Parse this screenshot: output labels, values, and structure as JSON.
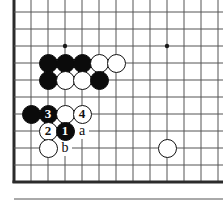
{
  "diagram": {
    "kind": "go-board-diagram",
    "board": {
      "grid_spacing_px": 17,
      "origin_x_px": 14,
      "origin_y_px": 12,
      "columns_visible": 13,
      "rows_visible": 11,
      "line_color": "#555555",
      "edge_color": "#2b2b2b",
      "background_color": "#ffffff",
      "left_edge_is_board_border": true,
      "bottom_edge_is_board_border": true,
      "top_edge_is_cut_off": true,
      "right_edge_is_cut_off": true
    },
    "star_points": [
      {
        "name": "star-point-left",
        "col": 3,
        "row": 2
      },
      {
        "name": "star-point-right",
        "col": 9,
        "row": 2
      }
    ],
    "stones": [
      {
        "name": "black-stone-c4",
        "color": "black",
        "col": 2,
        "row": 3,
        "label": ""
      },
      {
        "name": "black-stone-d4",
        "color": "black",
        "col": 3,
        "row": 3,
        "label": ""
      },
      {
        "name": "black-stone-e4",
        "color": "black",
        "col": 4,
        "row": 3,
        "label": ""
      },
      {
        "name": "white-stone-f4",
        "color": "white",
        "col": 5,
        "row": 3,
        "label": ""
      },
      {
        "name": "white-stone-g4",
        "color": "white",
        "col": 6,
        "row": 3,
        "label": ""
      },
      {
        "name": "black-stone-c5",
        "color": "black",
        "col": 2,
        "row": 4,
        "label": ""
      },
      {
        "name": "white-stone-d5",
        "color": "white",
        "col": 3,
        "row": 4,
        "label": ""
      },
      {
        "name": "white-stone-e5",
        "color": "white",
        "col": 4,
        "row": 4,
        "label": ""
      },
      {
        "name": "black-stone-f5",
        "color": "black",
        "col": 5,
        "row": 4,
        "label": ""
      },
      {
        "name": "black-stone-b7",
        "color": "black",
        "col": 1,
        "row": 6,
        "label": ""
      },
      {
        "name": "move-3-black",
        "color": "black",
        "col": 2,
        "row": 6,
        "label": "3"
      },
      {
        "name": "white-stone-d7",
        "color": "white",
        "col": 3,
        "row": 6,
        "label": ""
      },
      {
        "name": "move-4-white",
        "color": "white",
        "col": 4,
        "row": 6,
        "label": "4"
      },
      {
        "name": "move-2-white",
        "color": "white",
        "col": 2,
        "row": 7,
        "label": "2"
      },
      {
        "name": "move-1-black",
        "color": "black",
        "col": 3,
        "row": 7,
        "label": "1"
      },
      {
        "name": "white-stone-c9",
        "color": "white",
        "col": 2,
        "row": 8,
        "label": ""
      },
      {
        "name": "white-stone-j9",
        "color": "white",
        "col": 9,
        "row": 8,
        "label": ""
      }
    ],
    "point_labels": [
      {
        "name": "point-label-a",
        "text": "a",
        "col": 4,
        "row": 7
      },
      {
        "name": "point-label-b",
        "text": "b",
        "col": 3,
        "row": 8
      }
    ]
  }
}
